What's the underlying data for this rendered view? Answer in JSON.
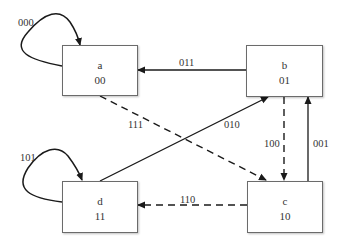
{
  "diagram": {
    "type": "state-transition",
    "states": [
      {
        "id": "a",
        "name": "a",
        "code": "00"
      },
      {
        "id": "b",
        "name": "b",
        "code": "01"
      },
      {
        "id": "c",
        "name": "c",
        "code": "10"
      },
      {
        "id": "d",
        "name": "d",
        "code": "11"
      }
    ],
    "transitions": [
      {
        "from": "a",
        "to": "a",
        "label": "000",
        "style": "solid"
      },
      {
        "from": "b",
        "to": "a",
        "label": "011",
        "style": "solid"
      },
      {
        "from": "a",
        "to": "c",
        "label": "111",
        "style": "dashed"
      },
      {
        "from": "d",
        "to": "b",
        "label": "010",
        "style": "solid"
      },
      {
        "from": "b",
        "to": "c",
        "label": "100",
        "style": "dashed"
      },
      {
        "from": "c",
        "to": "b",
        "label": "001",
        "style": "solid"
      },
      {
        "from": "d",
        "to": "d",
        "label": "101",
        "style": "solid"
      },
      {
        "from": "c",
        "to": "d",
        "label": "110",
        "style": "dashed"
      }
    ],
    "colors": {
      "line": "#1a1a1a",
      "box_border": "#6b6b6b",
      "text": "#333333"
    }
  }
}
